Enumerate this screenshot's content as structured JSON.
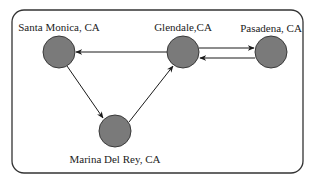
{
  "diagram": {
    "type": "directed-graph",
    "colors": {
      "node_fill": "#7a7a7a",
      "node_stroke": "#3a3a3a",
      "edge": "#1a1a1a",
      "frame": "#333333",
      "text": "#222222"
    },
    "nodes": [
      {
        "id": "santa_monica",
        "label": "Santa Monica, CA"
      },
      {
        "id": "glendale",
        "label": "Glendale,CA"
      },
      {
        "id": "pasadena",
        "label": "Pasadena, CA"
      },
      {
        "id": "marina_del_rey",
        "label": "Marina Del Rey, CA"
      }
    ],
    "edges": [
      {
        "from": "glendale",
        "to": "santa_monica"
      },
      {
        "from": "glendale",
        "to": "pasadena"
      },
      {
        "from": "pasadena",
        "to": "glendale"
      },
      {
        "from": "santa_monica",
        "to": "marina_del_rey"
      },
      {
        "from": "marina_del_rey",
        "to": "glendale"
      }
    ]
  }
}
